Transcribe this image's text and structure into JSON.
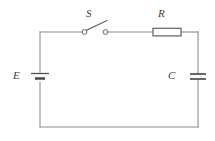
{
  "diagram": {
    "type": "circuit-schematic",
    "background_color": "#ffffff",
    "wire_color": "#8c8c8c",
    "label_color": "#3d3d3d",
    "labels": {
      "source": "E",
      "switch": "S",
      "resistor": "R",
      "capacitor": "C"
    },
    "components": [
      {
        "id": "source",
        "name": "battery",
        "label": "E",
        "position": "left-side",
        "symbol": "battery-cell"
      },
      {
        "id": "switch",
        "name": "switch",
        "label": "S",
        "position": "top-left",
        "symbol": "spst-switch-open",
        "state": "open"
      },
      {
        "id": "resistor",
        "name": "resistor",
        "label": "R",
        "position": "top-right",
        "symbol": "resistor-box"
      },
      {
        "id": "capacitor",
        "name": "capacitor",
        "label": "C",
        "position": "right-side",
        "symbol": "capacitor-parallel-plates"
      }
    ],
    "loop": {
      "left": 40,
      "right": 198,
      "top": 32,
      "bottom": 127
    }
  }
}
